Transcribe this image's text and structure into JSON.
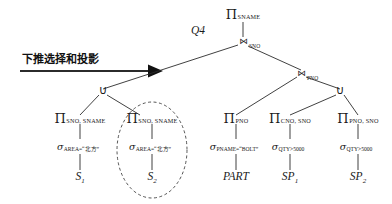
{
  "diagram": {
    "caption": "下推选择和投影",
    "query_label": "Q4",
    "arrow": "arrow-right",
    "nodes": {
      "root_project": {
        "op": "Π",
        "subscript": "SNAME"
      },
      "join_sno": {
        "op": "⋈",
        "subscript": "SNO"
      },
      "join_pno": {
        "op": "⋈",
        "subscript": "PNO"
      },
      "union_left": {
        "op": "∪"
      },
      "union_right": {
        "op": "∪"
      },
      "project_s1": {
        "op": "Π",
        "subscript": "SNO, SNAME"
      },
      "project_s2": {
        "op": "Π",
        "subscript": "SNO, SNAME"
      },
      "select_s1": {
        "op": "σ",
        "subscript": "AREA=“北方”"
      },
      "select_s2": {
        "op": "σ",
        "subscript": "AREA=“北方”"
      },
      "relation_s1": {
        "name": "S",
        "subscript": "1"
      },
      "relation_s2": {
        "name": "S",
        "subscript": "2"
      },
      "project_part": {
        "op": "Π",
        "subscript": "PNO"
      },
      "select_part": {
        "op": "σ",
        "subscript": "PNAME=“BOLT”"
      },
      "relation_part": {
        "name": "PART",
        "subscript": ""
      },
      "project_sp1": {
        "op": "Π",
        "subscript": "CNO, SNO"
      },
      "select_sp1": {
        "op": "σ",
        "subscript": "QTY>5000"
      },
      "relation_sp1": {
        "name": "SP",
        "subscript": "1"
      },
      "project_sp2": {
        "op": "Π",
        "subscript": "PNO, SNO"
      },
      "select_sp2": {
        "op": "σ",
        "subscript": "QTY>5000"
      },
      "relation_sp2": {
        "name": "SP",
        "subscript": "2"
      }
    },
    "colors": {
      "stroke": "#2b2b2b",
      "text": "#1a1a1a",
      "background": "#ffffff"
    }
  }
}
